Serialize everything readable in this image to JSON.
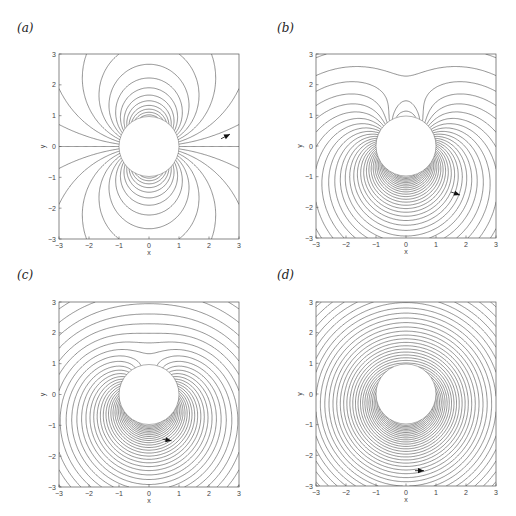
{
  "chart_data": [
    {
      "type": "line",
      "panel_label": "(a)",
      "title": "",
      "xlabel": "x",
      "ylabel": "y",
      "xlim": [
        -3,
        3
      ],
      "ylim": [
        -3,
        3
      ],
      "xticks": [
        "-3",
        "-2",
        "-1",
        "0",
        "1",
        "2",
        "3"
      ],
      "yticks": [
        "-3",
        "-2",
        "-1",
        "0",
        "1",
        "2",
        "3"
      ],
      "description": "Streamlines around unit cylinder, circulation 0 (dipole-like pattern)",
      "cylinder_radius": 1,
      "circulation": 0,
      "arrow": {
        "x": 2.7,
        "y": 0.4,
        "dx": 0.3,
        "dy": 0.15
      }
    },
    {
      "type": "line",
      "panel_label": "(b)",
      "title": "",
      "xlabel": "x",
      "ylabel": "y",
      "xlim": [
        -3,
        3
      ],
      "ylim": [
        -3,
        3
      ],
      "xticks": [
        "-3",
        "-2",
        "-1",
        "0",
        "1",
        "2",
        "3"
      ],
      "yticks": [
        "-3",
        "-2",
        "-1",
        "0",
        "1",
        "2",
        "3"
      ],
      "description": "Streamlines around unit cylinder with moderate circulation",
      "cylinder_radius": 1,
      "circulation": 0.55,
      "arrow": {
        "x": 1.8,
        "y": -1.6,
        "dx": 0.3,
        "dy": -0.1
      }
    },
    {
      "type": "line",
      "panel_label": "(c)",
      "title": "",
      "xlabel": "x",
      "ylabel": "y",
      "xlim": [
        -3,
        3
      ],
      "ylim": [
        -3,
        3
      ],
      "xticks": [
        "-3",
        "-2",
        "-1",
        "0",
        "1",
        "2",
        "3"
      ],
      "yticks": [
        "-3",
        "-2",
        "-1",
        "0",
        "1",
        "2",
        "3"
      ],
      "description": "Streamlines around unit cylinder with critical circulation (stagnation point at bottom)",
      "cylinder_radius": 1,
      "circulation": 1.0,
      "arrow": {
        "x": 0.75,
        "y": -1.5,
        "dx": 0.3,
        "dy": -0.05
      }
    },
    {
      "type": "line",
      "panel_label": "(d)",
      "title": "",
      "xlabel": "x",
      "ylabel": "y",
      "xlim": [
        -3,
        3
      ],
      "ylim": [
        -3,
        3
      ],
      "xticks": [
        "-3",
        "-2",
        "-1",
        "0",
        "1",
        "2",
        "3"
      ],
      "yticks": [
        "-3",
        "-2",
        "-1",
        "0",
        "1",
        "2",
        "3"
      ],
      "description": "Streamlines around unit cylinder with strong circulation (nearly concentric circles)",
      "cylinder_radius": 1,
      "circulation": 3.0,
      "arrow": {
        "x": 0.6,
        "y": -2.5,
        "dx": 0.3,
        "dy": 0
      }
    }
  ]
}
